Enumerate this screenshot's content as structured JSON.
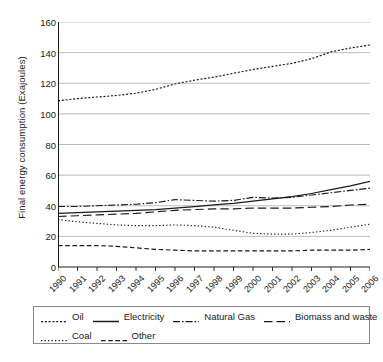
{
  "chart_data": {
    "type": "line",
    "title": "",
    "xlabel": "",
    "ylabel": "Final energy consumption (Exajoules)",
    "x": [
      1990,
      1991,
      1992,
      1993,
      1994,
      1995,
      1996,
      1997,
      1998,
      1999,
      2000,
      2001,
      2002,
      2003,
      2004,
      2005,
      2006
    ],
    "categories": [
      "1990",
      "1991",
      "1992",
      "1993",
      "1994",
      "1995",
      "1996",
      "1997",
      "1998",
      "1999",
      "2000",
      "2001",
      "2002",
      "2003",
      "2004",
      "2005",
      "2006"
    ],
    "ylim": [
      0,
      160
    ],
    "ytick_step": 20,
    "yticks": [
      "0",
      "20",
      "40",
      "60",
      "80",
      "100",
      "120",
      "140",
      "160"
    ],
    "grid": "horizontal",
    "legend_position": "bottom",
    "series": [
      {
        "name": "Oil",
        "dash": "dotted",
        "color": "#1a1a1a",
        "values": [
          108.5,
          110.0,
          111.0,
          112.0,
          113.5,
          116.0,
          119.5,
          122.0,
          124.0,
          126.5,
          129.0,
          131.0,
          133.0,
          136.0,
          140.5,
          143.0,
          145.0
        ]
      },
      {
        "name": "Electricity",
        "dash": "solid",
        "color": "#1a1a1a",
        "values": [
          35.0,
          35.5,
          36.0,
          36.5,
          37.0,
          37.5,
          38.5,
          39.5,
          40.5,
          41.5,
          43.0,
          44.5,
          46.0,
          48.0,
          50.5,
          53.0,
          56.0
        ]
      },
      {
        "name": "Natural Gas",
        "dash": "dashdot",
        "color": "#1a1a1a",
        "values": [
          39.5,
          39.5,
          40.0,
          40.5,
          41.0,
          42.0,
          44.0,
          43.5,
          43.0,
          43.5,
          45.5,
          45.0,
          45.5,
          47.0,
          48.5,
          50.0,
          51.5
        ]
      },
      {
        "name": "Biomass and waste",
        "dash": "longdash",
        "color": "#1a1a1a",
        "values": [
          33.0,
          33.5,
          34.0,
          34.5,
          35.0,
          36.0,
          37.0,
          37.5,
          38.0,
          38.0,
          38.5,
          38.5,
          38.5,
          39.0,
          39.5,
          40.5,
          41.0
        ]
      },
      {
        "name": "Coal",
        "dash": "finedot",
        "color": "#1a1a1a",
        "values": [
          31.0,
          29.5,
          28.5,
          27.5,
          27.0,
          27.0,
          27.5,
          27.0,
          26.0,
          24.0,
          22.0,
          21.5,
          21.5,
          22.5,
          24.0,
          26.0,
          28.0
        ]
      },
      {
        "name": "Other",
        "dash": "dashed",
        "color": "#1a1a1a",
        "values": [
          14.0,
          14.0,
          14.0,
          13.5,
          12.5,
          11.5,
          11.0,
          10.5,
          10.5,
          10.5,
          10.5,
          10.5,
          10.5,
          11.0,
          11.0,
          11.0,
          11.5
        ]
      }
    ]
  },
  "axis": {
    "y_title": "Final energy consumption (Exajoules)"
  },
  "legend": {
    "rows": [
      [
        "Oil",
        "Electricity",
        "Natural Gas",
        "Biomass and waste"
      ],
      [
        "Coal",
        "Other"
      ]
    ]
  }
}
